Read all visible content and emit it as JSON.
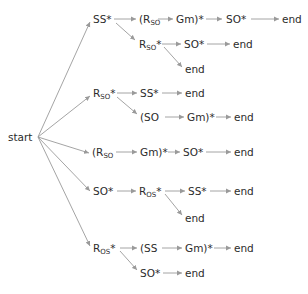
{
  "diagram": {
    "title": "",
    "colors": {
      "text": "#2b2b2b",
      "edge": "#9a9a9a",
      "background": "#ffffff"
    },
    "nodes": [
      {
        "id": "start",
        "label": "start",
        "sub": "",
        "post": "",
        "x": 8,
        "y": 137
      },
      {
        "id": "n1",
        "label": "SS*",
        "sub": "",
        "post": "",
        "x": 93,
        "y": 19
      },
      {
        "id": "n2",
        "label": "(R",
        "sub": "SO",
        "post": "",
        "x": 139,
        "y": 19
      },
      {
        "id": "n3",
        "label": "Gm)*",
        "sub": "",
        "post": "",
        "x": 176,
        "y": 19
      },
      {
        "id": "n4",
        "label": "SO*",
        "sub": "",
        "post": "",
        "x": 226,
        "y": 19
      },
      {
        "id": "n5",
        "label": "end",
        "sub": "",
        "post": "",
        "x": 282,
        "y": 19
      },
      {
        "id": "n6",
        "label": "R",
        "sub": "SO",
        "post": "*",
        "x": 139,
        "y": 44
      },
      {
        "id": "n7",
        "label": "SO*",
        "sub": "",
        "post": "",
        "x": 184,
        "y": 44
      },
      {
        "id": "n8",
        "label": "end",
        "sub": "",
        "post": "",
        "x": 233,
        "y": 44
      },
      {
        "id": "n9",
        "label": "end",
        "sub": "",
        "post": "",
        "x": 185,
        "y": 69
      },
      {
        "id": "n10",
        "label": "R",
        "sub": "SO",
        "post": "*",
        "x": 93,
        "y": 93
      },
      {
        "id": "n11",
        "label": "SS*",
        "sub": "",
        "post": "",
        "x": 140,
        "y": 93
      },
      {
        "id": "n12",
        "label": "end",
        "sub": "",
        "post": "",
        "x": 185,
        "y": 93
      },
      {
        "id": "n13",
        "label": "(SO",
        "sub": "",
        "post": "",
        "x": 140,
        "y": 117
      },
      {
        "id": "n14",
        "label": "Gm)*",
        "sub": "",
        "post": "",
        "x": 187,
        "y": 117
      },
      {
        "id": "n15",
        "label": "end",
        "sub": "",
        "post": "",
        "x": 234,
        "y": 117
      },
      {
        "id": "n16",
        "label": "(R",
        "sub": "SO",
        "post": "",
        "x": 92,
        "y": 152
      },
      {
        "id": "n17",
        "label": "Gm)*",
        "sub": "",
        "post": "",
        "x": 140,
        "y": 152
      },
      {
        "id": "n18",
        "label": "SO*",
        "sub": "",
        "post": "",
        "x": 183,
        "y": 152
      },
      {
        "id": "n19",
        "label": "end",
        "sub": "",
        "post": "",
        "x": 234,
        "y": 152
      },
      {
        "id": "n20",
        "label": "SO*",
        "sub": "",
        "post": "",
        "x": 93,
        "y": 191
      },
      {
        "id": "n21",
        "label": "R",
        "sub": "OS",
        "post": "*",
        "x": 139,
        "y": 191
      },
      {
        "id": "n22",
        "label": "SS*",
        "sub": "",
        "post": "",
        "x": 188,
        "y": 191
      },
      {
        "id": "n23",
        "label": "end",
        "sub": "",
        "post": "",
        "x": 234,
        "y": 191
      },
      {
        "id": "n24",
        "label": "end",
        "sub": "",
        "post": "",
        "x": 185,
        "y": 218
      },
      {
        "id": "n25",
        "label": "R",
        "sub": "OS",
        "post": "*",
        "x": 93,
        "y": 248
      },
      {
        "id": "n26",
        "label": "(SS",
        "sub": "",
        "post": "",
        "x": 140,
        "y": 248
      },
      {
        "id": "n27",
        "label": "Gm)*",
        "sub": "",
        "post": "",
        "x": 185,
        "y": 248
      },
      {
        "id": "n28",
        "label": "end",
        "sub": "",
        "post": "",
        "x": 234,
        "y": 248
      },
      {
        "id": "n29",
        "label": "SO*",
        "sub": "",
        "post": "",
        "x": 140,
        "y": 273
      },
      {
        "id": "n30",
        "label": "end",
        "sub": "",
        "post": "",
        "x": 185,
        "y": 273
      }
    ],
    "edges": [
      {
        "from": "start",
        "to": "n1",
        "x1": 38,
        "y1": 137,
        "x2": 90,
        "y2": 22
      },
      {
        "from": "start",
        "to": "n10",
        "x1": 38,
        "y1": 137,
        "x2": 90,
        "y2": 96
      },
      {
        "from": "start",
        "to": "n16",
        "x1": 38,
        "y1": 137,
        "x2": 89,
        "y2": 153
      },
      {
        "from": "start",
        "to": "n20",
        "x1": 38,
        "y1": 137,
        "x2": 90,
        "y2": 191
      },
      {
        "from": "start",
        "to": "n25",
        "x1": 38,
        "y1": 137,
        "x2": 90,
        "y2": 246
      },
      {
        "from": "n1",
        "to": "n2",
        "x1": 114,
        "y1": 19,
        "x2": 136,
        "y2": 19
      },
      {
        "from": "n1",
        "to": "n6",
        "x1": 116,
        "y1": 23,
        "x2": 135,
        "y2": 40
      },
      {
        "from": "n2",
        "to": "n3",
        "x1": 158,
        "y1": 19,
        "x2": 173,
        "y2": 19
      },
      {
        "from": "n3",
        "to": "n4",
        "x1": 206,
        "y1": 19,
        "x2": 222,
        "y2": 19
      },
      {
        "from": "n4",
        "to": "n5",
        "x1": 251,
        "y1": 19,
        "x2": 279,
        "y2": 19
      },
      {
        "from": "n6",
        "to": "n7",
        "x1": 162,
        "y1": 44,
        "x2": 181,
        "y2": 44
      },
      {
        "from": "n6",
        "to": "n9",
        "x1": 164,
        "y1": 47,
        "x2": 182,
        "y2": 67
      },
      {
        "from": "n7",
        "to": "n8",
        "x1": 207,
        "y1": 44,
        "x2": 230,
        "y2": 44
      },
      {
        "from": "n10",
        "to": "n11",
        "x1": 117,
        "y1": 93,
        "x2": 137,
        "y2": 93
      },
      {
        "from": "n10",
        "to": "n13",
        "x1": 117,
        "y1": 97,
        "x2": 137,
        "y2": 114
      },
      {
        "from": "n11",
        "to": "n12",
        "x1": 162,
        "y1": 93,
        "x2": 182,
        "y2": 93
      },
      {
        "from": "n13",
        "to": "n14",
        "x1": 165,
        "y1": 117,
        "x2": 184,
        "y2": 117
      },
      {
        "from": "n14",
        "to": "n15",
        "x1": 216,
        "y1": 117,
        "x2": 231,
        "y2": 117
      },
      {
        "from": "n16",
        "to": "n17",
        "x1": 116,
        "y1": 152,
        "x2": 137,
        "y2": 152
      },
      {
        "from": "n17",
        "to": "n18",
        "x1": 168,
        "y1": 152,
        "x2": 180,
        "y2": 152
      },
      {
        "from": "n18",
        "to": "n19",
        "x1": 206,
        "y1": 152,
        "x2": 231,
        "y2": 152
      },
      {
        "from": "n20",
        "to": "n21",
        "x1": 117,
        "y1": 191,
        "x2": 136,
        "y2": 191
      },
      {
        "from": "n21",
        "to": "n22",
        "x1": 165,
        "y1": 191,
        "x2": 185,
        "y2": 191
      },
      {
        "from": "n21",
        "to": "n24",
        "x1": 165,
        "y1": 194,
        "x2": 182,
        "y2": 215
      },
      {
        "from": "n22",
        "to": "n23",
        "x1": 210,
        "y1": 191,
        "x2": 231,
        "y2": 191
      },
      {
        "from": "n25",
        "to": "n26",
        "x1": 120,
        "y1": 248,
        "x2": 137,
        "y2": 248
      },
      {
        "from": "n25",
        "to": "n29",
        "x1": 120,
        "y1": 251,
        "x2": 137,
        "y2": 270
      },
      {
        "from": "n26",
        "to": "n27",
        "x1": 162,
        "y1": 248,
        "x2": 182,
        "y2": 248
      },
      {
        "from": "n27",
        "to": "n28",
        "x1": 214,
        "y1": 248,
        "x2": 231,
        "y2": 248
      },
      {
        "from": "n29",
        "to": "n30",
        "x1": 163,
        "y1": 273,
        "x2": 182,
        "y2": 273
      }
    ]
  }
}
